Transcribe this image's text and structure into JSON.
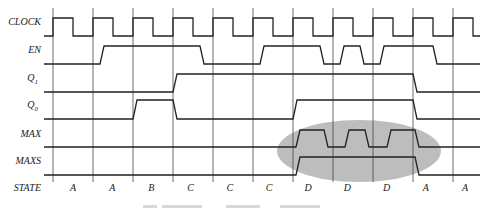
{
  "diagram": {
    "type": "timing-diagram",
    "signals": [
      {
        "name": "CLOCK",
        "label": "CLOCK",
        "subscript": "",
        "y_high": 18,
        "y_low": 36,
        "points": [
          [
            44,
            36
          ],
          [
            53,
            36
          ],
          [
            53,
            18
          ],
          [
            73,
            18
          ],
          [
            73,
            36
          ],
          [
            93,
            36
          ],
          [
            93,
            18
          ],
          [
            113,
            18
          ],
          [
            113,
            36
          ],
          [
            133,
            36
          ],
          [
            133,
            18
          ],
          [
            153,
            18
          ],
          [
            153,
            36
          ],
          [
            173,
            36
          ],
          [
            173,
            18
          ],
          [
            193,
            18
          ],
          [
            193,
            36
          ],
          [
            213,
            36
          ],
          [
            213,
            18
          ],
          [
            233,
            18
          ],
          [
            233,
            36
          ],
          [
            253,
            36
          ],
          [
            253,
            18
          ],
          [
            273,
            18
          ],
          [
            273,
            36
          ],
          [
            293,
            36
          ],
          [
            293,
            18
          ],
          [
            313,
            18
          ],
          [
            313,
            36
          ],
          [
            333,
            36
          ],
          [
            333,
            18
          ],
          [
            353,
            18
          ],
          [
            353,
            36
          ],
          [
            373,
            36
          ],
          [
            373,
            18
          ],
          [
            393,
            18
          ],
          [
            393,
            36
          ],
          [
            413,
            36
          ],
          [
            413,
            18
          ],
          [
            433,
            18
          ],
          [
            433,
            36
          ],
          [
            453,
            36
          ],
          [
            453,
            18
          ],
          [
            473,
            18
          ],
          [
            473,
            36
          ],
          [
            480,
            36
          ]
        ]
      },
      {
        "name": "EN",
        "label": "EN",
        "subscript": "",
        "y_high": 46,
        "y_low": 64,
        "points": [
          [
            44,
            64
          ],
          [
            100,
            64
          ],
          [
            104,
            46
          ],
          [
            200,
            46
          ],
          [
            204,
            64
          ],
          [
            260,
            64
          ],
          [
            264,
            46
          ],
          [
            320,
            46
          ],
          [
            324,
            64
          ],
          [
            340,
            64
          ],
          [
            344,
            46
          ],
          [
            360,
            46
          ],
          [
            364,
            64
          ],
          [
            380,
            64
          ],
          [
            384,
            46
          ],
          [
            433,
            46
          ],
          [
            437,
            64
          ],
          [
            480,
            64
          ]
        ]
      },
      {
        "name": "Q1",
        "label": "Q",
        "subscript": "1",
        "y_high": 74,
        "y_low": 92,
        "points": [
          [
            44,
            92
          ],
          [
            173,
            92
          ],
          [
            177,
            74
          ],
          [
            413,
            74
          ],
          [
            417,
            92
          ],
          [
            480,
            92
          ]
        ]
      },
      {
        "name": "Q0",
        "label": "Q",
        "subscript": "0",
        "y_high": 100,
        "y_low": 119,
        "points": [
          [
            44,
            119
          ],
          [
            133,
            119
          ],
          [
            137,
            100
          ],
          [
            173,
            100
          ],
          [
            177,
            119
          ],
          [
            293,
            119
          ],
          [
            297,
            100
          ],
          [
            413,
            100
          ],
          [
            417,
            119
          ],
          [
            480,
            119
          ]
        ]
      },
      {
        "name": "MAX",
        "label": "MAX",
        "subscript": "",
        "y_high": 130,
        "y_low": 147,
        "points": [
          [
            44,
            147
          ],
          [
            296,
            147
          ],
          [
            300,
            130
          ],
          [
            324,
            130
          ],
          [
            328,
            147
          ],
          [
            345,
            147
          ],
          [
            349,
            130
          ],
          [
            365,
            130
          ],
          [
            369,
            147
          ],
          [
            387,
            147
          ],
          [
            391,
            130
          ],
          [
            415,
            130
          ],
          [
            419,
            147
          ],
          [
            480,
            147
          ]
        ]
      },
      {
        "name": "MAXS",
        "label": "MAXS",
        "subscript": "",
        "y_high": 157,
        "y_low": 175,
        "points": [
          [
            44,
            175
          ],
          [
            296,
            175
          ],
          [
            300,
            157
          ],
          [
            415,
            157
          ],
          [
            419,
            175
          ],
          [
            480,
            175
          ]
        ]
      }
    ],
    "state_row": {
      "label": "STATE",
      "values": [
        "A",
        "A",
        "B",
        "C",
        "C",
        "C",
        "D",
        "D",
        "D",
        "A",
        "A"
      ]
    },
    "grid": {
      "x_positions": [
        53,
        93,
        133,
        173,
        213,
        253,
        293,
        333,
        373,
        413,
        453
      ],
      "y_top": 8,
      "y_bottom": 182
    },
    "highlight": {
      "shape": "ellipse",
      "cx": 359,
      "cy": 151,
      "rx": 82,
      "ry": 31,
      "color": "#bdbdbd"
    }
  }
}
